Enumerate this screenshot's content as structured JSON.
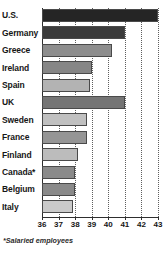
{
  "chart_data": {
    "type": "bar",
    "orientation": "horizontal",
    "title": "",
    "subtitle": "",
    "xlabel": "",
    "ylabel": "",
    "xlim": [
      36,
      43
    ],
    "ticks": [
      "36",
      "37",
      "38",
      "39",
      "40",
      "41",
      "42",
      "43"
    ],
    "grid": true,
    "grid_style": "dotted-vertical",
    "legend": "none",
    "footnote": "*Salaried employees",
    "categories": [
      "U.S.",
      "Germany",
      "Greece",
      "Ireland",
      "Spain",
      "UK",
      "Sweden",
      "France",
      "Finland",
      "Canada*",
      "Belgium",
      "Italy"
    ],
    "values": [
      43.0,
      41.0,
      40.2,
      39.0,
      38.9,
      41.0,
      38.7,
      38.7,
      38.2,
      38.0,
      38.0,
      37.9
    ],
    "bar_colors": [
      "#252525",
      "#3b3b3b",
      "#8e8e8e",
      "#868686",
      "#b3b3b3",
      "#757575",
      "#c0c0c0",
      "#959595",
      "#bcbcbc",
      "#8a8a8a",
      "#8a8a8a",
      "#cacaca"
    ],
    "bar_border_color": "#4a4a4a",
    "axis_color": "#2e2e2e",
    "background": "#ffffff"
  }
}
